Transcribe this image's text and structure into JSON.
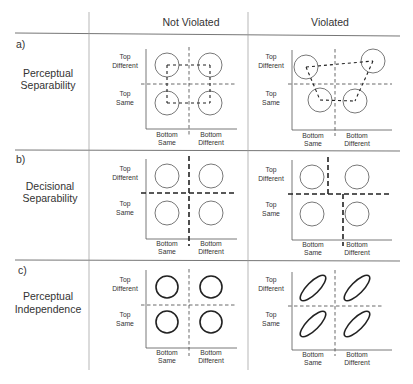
{
  "header": {
    "col1": "Not Violated",
    "col2": "Violated"
  },
  "rows": [
    {
      "letter": "a)",
      "title_line1": "Perceptual",
      "title_line2": "Separability"
    },
    {
      "letter": "b)",
      "title_line1": "Decisional",
      "title_line2": "Separability"
    },
    {
      "letter": "c)",
      "title_line1": "Perceptual",
      "title_line2": "Independence"
    }
  ],
  "axis_labels": {
    "top_different_1": "Top",
    "top_different_2": "Different",
    "top_same_1": "Top",
    "top_same_2": "Same",
    "bottom_same_1": "Bottom",
    "bottom_same_2": "Same",
    "bottom_different_1": "Bottom",
    "bottom_different_2": "Different"
  }
}
